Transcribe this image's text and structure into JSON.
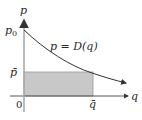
{
  "diagram": {
    "title": "",
    "axes": {
      "x_label": "q",
      "y_label": "p",
      "origin_label": "0"
    },
    "curve": {
      "label": "p = D(q)",
      "color": "#333333"
    },
    "points": {
      "p0_label": "p",
      "p0_subscript": "0",
      "pbar_label": "p̄",
      "qbar_label": "q̄"
    },
    "region": {
      "fill_color": "#c8c8c8",
      "border_color": "#999999"
    }
  }
}
